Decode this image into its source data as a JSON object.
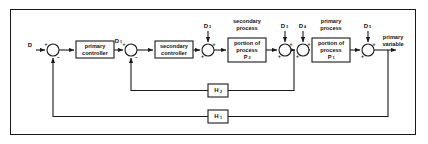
{
  "figure": {
    "type": "block-diagram",
    "border_color": "#1a1a1a",
    "background": "#ffffff",
    "line_color": "#1a1a1a"
  },
  "blocks": [
    {
      "id": "primary-controller",
      "line1": "primary",
      "line2": "controller",
      "line3": "",
      "x": 76,
      "y": 41,
      "w": 38,
      "h": 17
    },
    {
      "id": "secondary-controller",
      "line1": "secondary",
      "line2": "controller",
      "line3": "",
      "x": 155,
      "y": 41,
      "w": 38,
      "h": 17
    },
    {
      "id": "secondary-process-block",
      "line1": "portion of",
      "line2": "process",
      "line3": "P",
      "sub": "2",
      "x": 228,
      "y": 38,
      "w": 38,
      "h": 24
    },
    {
      "id": "primary-process-block",
      "line1": "portion of",
      "line2": "process",
      "line3": "P",
      "sub": "1",
      "x": 312,
      "y": 38,
      "w": 38,
      "h": 24
    }
  ],
  "group_labels": [
    {
      "id": "secondary-process-label",
      "line1": "secondary",
      "line2": "process",
      "cx": 247,
      "y1": 22,
      "y2": 29
    },
    {
      "id": "primary-process-label",
      "line1": "primary",
      "line2": "process",
      "cx": 331,
      "y1": 22,
      "y2": 29
    }
  ],
  "signals": {
    "input": {
      "symbol": "D",
      "sub": "",
      "x": 30,
      "y": 46
    },
    "intermediate": {
      "symbol": "D",
      "sub": "1",
      "x": 118,
      "y": 42
    },
    "output_line1": "primary",
    "output_line2": "variable",
    "output_cx": 392,
    "output_y1": 38,
    "output_y2": 45
  },
  "disturbances": [
    {
      "id": "d2",
      "symbol": "D",
      "sub": "2",
      "x": 206,
      "y": 27,
      "junction_x": 208,
      "junction_y": 50
    },
    {
      "id": "d3",
      "symbol": "D",
      "sub": "3",
      "x": 283,
      "y": 27,
      "junction_x": 285,
      "junction_y": 50
    },
    {
      "id": "d4",
      "symbol": "D",
      "sub": "4",
      "x": 301,
      "y": 27,
      "junction_x": 303,
      "junction_y": 50
    },
    {
      "id": "d5",
      "symbol": "D",
      "sub": "5",
      "x": 366,
      "y": 27,
      "junction_x": 368,
      "junction_y": 50
    }
  ],
  "junctions": [
    {
      "id": "sum-outer",
      "cx": 53,
      "cy": 50,
      "r": 6,
      "signs": {
        "left": "+",
        "bottom": "−"
      }
    },
    {
      "id": "sum-inner",
      "cx": 131,
      "cy": 50,
      "r": 6,
      "signs": {
        "left": "+",
        "bottom": "−"
      }
    },
    {
      "id": "sum-d2",
      "cx": 208,
      "cy": 50,
      "r": 6,
      "signs": {
        "top": "+",
        "left": "+"
      }
    },
    {
      "id": "sum-d3",
      "cx": 285,
      "cy": 50,
      "r": 6,
      "signs": {
        "top": "+",
        "left": "+"
      }
    },
    {
      "id": "sum-d4",
      "cx": 303,
      "cy": 50,
      "r": 6,
      "signs": {
        "top": "+",
        "left": "+"
      }
    },
    {
      "id": "sum-d5",
      "cx": 368,
      "cy": 50,
      "r": 6,
      "signs": {
        "top": "+",
        "left": "+"
      }
    }
  ],
  "feedback": [
    {
      "id": "h2",
      "symbol": "H",
      "sub": "2",
      "x": 208,
      "y": 84,
      "w": 20,
      "h": 13,
      "tap_x": 294,
      "return_x": 131,
      "label": "inner-loop"
    },
    {
      "id": "h1",
      "symbol": "H",
      "sub": "1",
      "x": 208,
      "y": 110,
      "w": 20,
      "h": 13,
      "tap_x": 388,
      "return_x": 53,
      "label": "outer-loop"
    }
  ]
}
